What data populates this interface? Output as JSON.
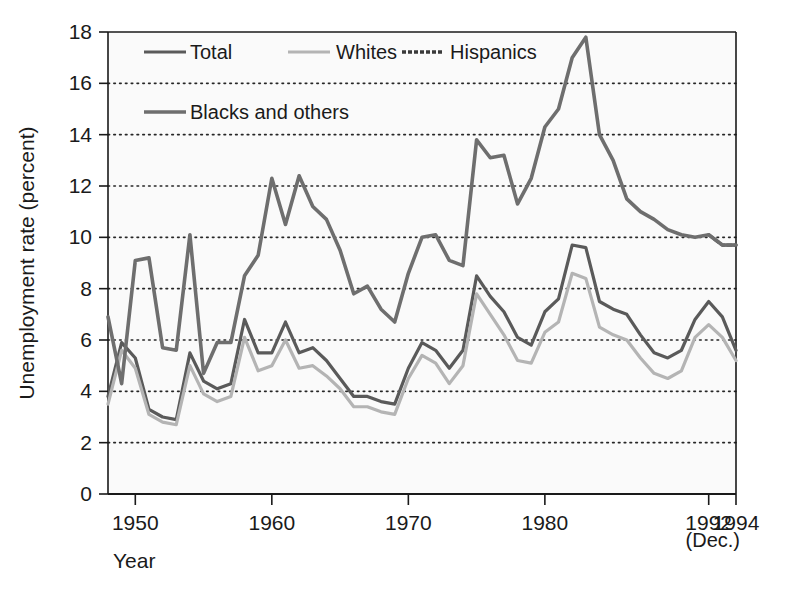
{
  "chart_data": {
    "type": "line",
    "title": "",
    "xlabel": "Year",
    "ylabel": "Unemployment rate (percent)",
    "xlim": [
      1948,
      1994
    ],
    "ylim": [
      0,
      18
    ],
    "ytick_values": [
      0,
      2,
      4,
      6,
      8,
      10,
      12,
      14,
      16,
      18
    ],
    "ytick_labels": [
      "0",
      "2",
      "4",
      "6",
      "8",
      "10",
      "12",
      "14",
      "16",
      "18"
    ],
    "xtick_values": [
      1950,
      1960,
      1970,
      1980,
      1992,
      1994
    ],
    "xtick_labels": [
      "1950",
      "1960",
      "1970",
      "1980",
      "1992",
      "1994"
    ],
    "x_axis_note": "(Dec.)",
    "grid": "horizontal-dotted",
    "legend_position": "top-left-inside",
    "x": [
      1948,
      1949,
      1950,
      1951,
      1952,
      1953,
      1954,
      1955,
      1956,
      1957,
      1958,
      1959,
      1960,
      1961,
      1962,
      1963,
      1964,
      1965,
      1966,
      1967,
      1968,
      1969,
      1970,
      1971,
      1972,
      1973,
      1974,
      1975,
      1976,
      1977,
      1978,
      1979,
      1980,
      1981,
      1982,
      1983,
      1984,
      1985,
      1986,
      1987,
      1988,
      1989,
      1990,
      1991,
      1992,
      1993,
      1994
    ],
    "series": [
      {
        "name": "Total",
        "color": "#5a5a5a",
        "style": "solid",
        "width": 3.2,
        "values": [
          3.8,
          5.9,
          5.3,
          3.3,
          3.0,
          2.9,
          5.5,
          4.4,
          4.1,
          4.3,
          6.8,
          5.5,
          5.5,
          6.7,
          5.5,
          5.7,
          5.2,
          4.5,
          3.8,
          3.8,
          3.6,
          3.5,
          4.9,
          5.9,
          5.6,
          4.9,
          5.6,
          8.5,
          7.7,
          7.1,
          6.1,
          5.8,
          7.1,
          7.6,
          9.7,
          9.6,
          7.5,
          7.2,
          7.0,
          6.2,
          5.5,
          5.3,
          5.6,
          6.8,
          7.5,
          6.9,
          5.6
        ]
      },
      {
        "name": "Whites",
        "color": "#b4b4b4",
        "style": "solid",
        "width": 3.2,
        "values": [
          3.5,
          5.6,
          4.9,
          3.1,
          2.8,
          2.7,
          5.0,
          3.9,
          3.6,
          3.8,
          6.1,
          4.8,
          5.0,
          6.0,
          4.9,
          5.0,
          4.6,
          4.1,
          3.4,
          3.4,
          3.2,
          3.1,
          4.5,
          5.4,
          5.1,
          4.3,
          5.0,
          7.8,
          7.0,
          6.2,
          5.2,
          5.1,
          6.3,
          6.7,
          8.6,
          8.4,
          6.5,
          6.2,
          6.0,
          5.3,
          4.7,
          4.5,
          4.8,
          6.1,
          6.6,
          6.1,
          5.2
        ]
      },
      {
        "name": "Hispanics",
        "color": "#3a3a3a",
        "style": "dashed",
        "width": 3.2,
        "values": [
          null,
          null,
          null,
          null,
          null,
          null,
          null,
          null,
          null,
          null,
          null,
          null,
          null,
          null,
          null,
          null,
          null,
          null,
          null,
          null,
          null,
          null,
          null,
          null,
          null,
          null,
          null,
          null,
          null,
          null,
          null,
          null,
          null,
          null,
          null,
          null,
          null,
          null,
          null,
          null,
          null,
          null,
          null,
          null,
          10.1,
          9.7,
          9.7
        ]
      },
      {
        "name": "Blacks and others",
        "color": "#6e6e6e",
        "style": "solid",
        "width": 3.6,
        "values": [
          6.9,
          4.3,
          9.1,
          9.2,
          5.7,
          5.6,
          10.1,
          4.7,
          5.9,
          5.9,
          8.5,
          9.3,
          12.3,
          10.5,
          12.4,
          11.2,
          10.7,
          9.5,
          7.8,
          8.1,
          7.2,
          6.7,
          8.6,
          10.0,
          10.1,
          9.1,
          8.9,
          13.8,
          13.1,
          13.2,
          11.3,
          12.3,
          14.3,
          15.0,
          17.0,
          17.8,
          14.0,
          13.0,
          11.5,
          11.0,
          10.7,
          10.3,
          10.1,
          10.0,
          10.1,
          9.7,
          9.7
        ]
      }
    ]
  },
  "legend": {
    "items": [
      {
        "label": "Total",
        "key": "total"
      },
      {
        "label": "Whites",
        "key": "whites"
      },
      {
        "label": "Hispanics",
        "key": "hispanics"
      },
      {
        "label": "Blacks and others",
        "key": "blacks-and-others"
      }
    ]
  },
  "axes": {
    "y_title": "Unemployment rate (percent)",
    "x_title": "Year",
    "x_note": "(Dec.)"
  }
}
